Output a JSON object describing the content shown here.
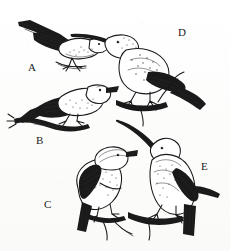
{
  "plate": {
    "title": "Bird species illustration plate",
    "description": "Pen-and-ink scientific illustration plate of five perching birds",
    "background_color": "#fdfdfc",
    "ink_color": "#1a1a1a",
    "width": 230,
    "height": 251
  },
  "figures": [
    {
      "label": "A",
      "label_x": 28,
      "label_y": 62,
      "name": "bird-a",
      "description": "Small bird facing right, horizontal posture, dark heavily-barred wing and long pointed tail extending to upper left, perched on a thin twig",
      "bill": "short straight",
      "facing": "right",
      "posture": "horizontal"
    },
    {
      "label": "B",
      "label_x": 36,
      "label_y": 135,
      "name": "bird-b",
      "description": "Bird facing right with stout conical bill, speckled breast, dark streaked wing, gripping a gnarled branch at the lower left",
      "bill": "stout conical",
      "facing": "right",
      "posture": "horizontal"
    },
    {
      "label": "C",
      "label_x": 44,
      "label_y": 199,
      "name": "bird-c",
      "description": "Bird facing upper right with short thick bill and rounded crown, spotted underparts and streaked back, perched upright on a forked branch",
      "bill": "short thick",
      "facing": "upper-right",
      "posture": "upright"
    },
    {
      "label": "D",
      "label_x": 178,
      "label_y": 27,
      "name": "bird-d",
      "description": "Bird facing left with long decurved bill, mottled crown and nape, long graduated tail sweeping down to the right, perched on a branch with small leaf buds",
      "bill": "long decurved",
      "facing": "left",
      "posture": "leaning-forward"
    },
    {
      "label": "E",
      "label_x": 201,
      "label_y": 161,
      "name": "bird-e",
      "description": "Upright bird with very long sickle-shaped decurved bill raised to the upper left, speckled throat and streaked flanks, long tail pointing down, perched on a horizontal branch",
      "bill": "very long sickle decurved",
      "facing": "upper-left",
      "posture": "upright"
    }
  ]
}
